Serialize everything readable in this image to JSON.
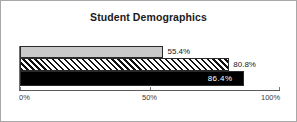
{
  "chart_data": {
    "type": "bar",
    "orientation": "horizontal",
    "title": "Student Demographics",
    "xlabel": "",
    "ylabel": "",
    "categories": [
      ""
    ],
    "series": [
      {
        "name": "series-1",
        "values": [
          55.4
        ],
        "label": "55.4%",
        "fill": "light-gray",
        "color": "#c9c9c9",
        "label_position": "outside"
      },
      {
        "name": "series-2",
        "values": [
          80.8
        ],
        "label": "80.8%",
        "fill": "diagonal-hatch",
        "color": "#111111",
        "label_position": "outside"
      },
      {
        "name": "series-3",
        "values": [
          86.4
        ],
        "label": "86.4%",
        "fill": "solid-black",
        "color": "#000000",
        "label_position": "inside"
      }
    ],
    "xlim": [
      0,
      100
    ],
    "ticks": [
      {
        "value": 0,
        "label": "0%"
      },
      {
        "value": 50,
        "label": "50%"
      },
      {
        "value": 100,
        "label": "100%"
      }
    ],
    "grid": false,
    "legend": "none"
  },
  "frame": {
    "border_color": "#a8a8a8",
    "background": "#ffffff"
  }
}
